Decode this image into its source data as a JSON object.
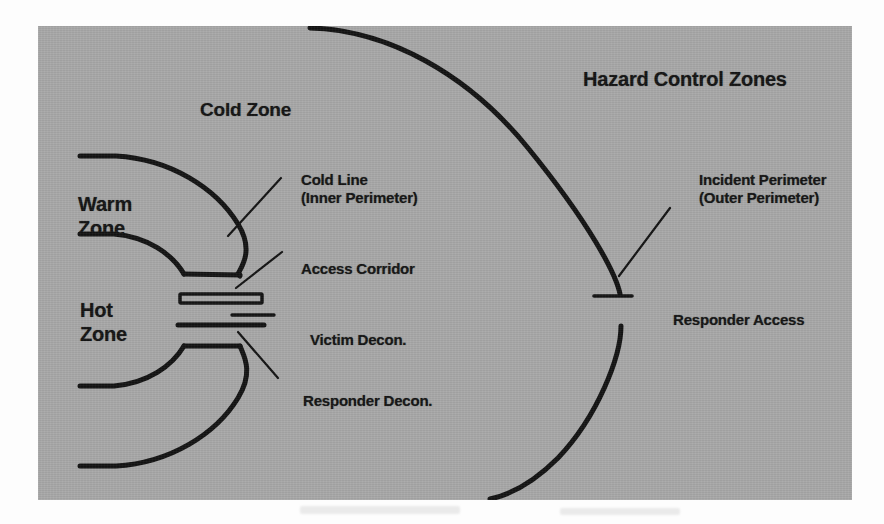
{
  "figure": {
    "title": "Hazard Control Zones",
    "background_color": "#a8a8a8",
    "line_color": "#131313",
    "page_color": "#fdfdfd"
  },
  "zones": [
    {
      "id": "cold-zone",
      "label": "Cold Zone"
    },
    {
      "id": "warm-zone",
      "label": "Warm\nZone",
      "line1": "Warm",
      "line2": "Zone"
    },
    {
      "id": "hot-zone",
      "label": "Hot\nZone",
      "line1": "Hot",
      "line2": "Zone"
    }
  ],
  "callouts": [
    {
      "id": "cold-line",
      "line1": "Cold Line",
      "line2": "(Inner Perimeter)"
    },
    {
      "id": "access-corridor",
      "line1": "Access Corridor",
      "line2": ""
    },
    {
      "id": "victim-decon",
      "line1": "Victim Decon.",
      "line2": ""
    },
    {
      "id": "responder-decon",
      "line1": "Responder Decon.",
      "line2": ""
    },
    {
      "id": "incident-perimeter",
      "line1": "Incident Perimeter",
      "line2": "(Outer Perimeter)"
    },
    {
      "id": "responder-access",
      "line1": "Responder Access",
      "line2": ""
    }
  ],
  "labels": {
    "title": "Hazard Control Zones",
    "cold_zone": "Cold Zone",
    "warm_zone_line1": "Warm",
    "warm_zone_line2": "Zone",
    "hot_zone_line1": "Hot",
    "hot_zone_line2": "Zone",
    "cold_line_line1": "Cold Line",
    "cold_line_line2": "(Inner Perimeter)",
    "access_corridor": "Access Corridor",
    "victim_decon": "Victim Decon.",
    "responder_decon": "Responder Decon.",
    "incident_perimeter_line1": "Incident Perimeter",
    "incident_perimeter_line2": "(Outer Perimeter)",
    "responder_access": "Responder Access"
  }
}
